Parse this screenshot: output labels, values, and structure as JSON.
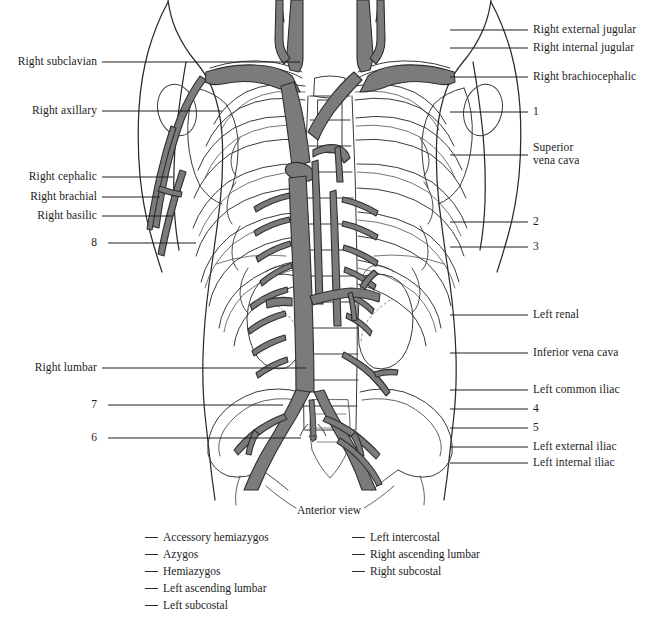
{
  "figure": {
    "title": "Anterior view",
    "view_caption": "Anterior view",
    "colors": {
      "vessel_fill": "#7b7b7b",
      "vessel_stroke": "#2e2e2e",
      "outline_stroke": "#2a2a2a",
      "bone_stroke": "#3a3a3a",
      "leader_line": "#1f1f1f",
      "text": "#1c1c1c",
      "background": "#ffffff"
    }
  },
  "labels_left": [
    {
      "text": "Right subclavian",
      "y": 62,
      "line_y": 62,
      "line_x1": 102,
      "line_x2": 300
    },
    {
      "text": "Right axillary",
      "y": 111,
      "line_y": 111,
      "line_x1": 102,
      "line_x2": 222
    },
    {
      "text": "Right cephalic",
      "y": 177,
      "line_y": 177,
      "line_x1": 102,
      "line_x2": 173
    },
    {
      "text": "Right brachial",
      "y": 197,
      "line_y": 197,
      "line_x1": 102,
      "line_x2": 160
    },
    {
      "text": "Right basilic",
      "y": 216,
      "line_y": 216,
      "line_x1": 102,
      "line_x2": 173
    },
    {
      "text": "8",
      "y": 243,
      "line_y": 243,
      "line_x1": 108,
      "line_x2": 196
    },
    {
      "text": "Right lumbar",
      "y": 368,
      "line_y": 368,
      "line_x1": 102,
      "line_x2": 306
    },
    {
      "text": "7",
      "y": 405,
      "line_y": 405,
      "line_x1": 108,
      "line_x2": 283
    },
    {
      "text": "6",
      "y": 438,
      "line_y": 438,
      "line_x1": 108,
      "line_x2": 301
    }
  ],
  "labels_right": [
    {
      "text": "Right external jugular",
      "y": 30,
      "line_y": 30,
      "line_x1": 450,
      "line_x2": 528
    },
    {
      "text": "Right internal jugular",
      "y": 48,
      "line_y": 48,
      "line_x1": 450,
      "line_x2": 528
    },
    {
      "text": "Right brachiocephalic",
      "y": 77,
      "line_y": 77,
      "line_x1": 450,
      "line_x2": 528
    },
    {
      "text": "1",
      "y": 112,
      "line_y": 112,
      "line_x1": 450,
      "line_x2": 528
    },
    {
      "text": "Superior\nvena cava",
      "y": 148,
      "line_y": 155,
      "line_x1": 450,
      "line_x2": 528
    },
    {
      "text": "2",
      "y": 222,
      "line_y": 222,
      "line_x1": 450,
      "line_x2": 528
    },
    {
      "text": "3",
      "y": 247,
      "line_y": 247,
      "line_x1": 450,
      "line_x2": 528
    },
    {
      "text": "Left renal",
      "y": 315,
      "line_y": 315,
      "line_x1": 450,
      "line_x2": 528
    },
    {
      "text": "Inferior vena cava",
      "y": 353,
      "line_y": 353,
      "line_x1": 450,
      "line_x2": 528
    },
    {
      "text": "Left common iliac",
      "y": 390,
      "line_y": 390,
      "line_x1": 450,
      "line_x2": 528
    },
    {
      "text": "4",
      "y": 409,
      "line_y": 409,
      "line_x1": 450,
      "line_x2": 528
    },
    {
      "text": "5",
      "y": 428,
      "line_y": 428,
      "line_x1": 450,
      "line_x2": 528
    },
    {
      "text": "Left external iliac",
      "y": 447,
      "line_y": 447,
      "line_x1": 450,
      "line_x2": 528
    },
    {
      "text": "Left internal iliac",
      "y": 463,
      "line_y": 463,
      "line_x1": 450,
      "line_x2": 528
    }
  ],
  "legend": {
    "column_left": [
      "Accessory hemiazygos",
      "Azygos",
      "Hemiazygos",
      "Left ascending lumbar",
      "Left subcostal"
    ],
    "column_right": [
      "Left intercostal",
      "Right ascending lumbar",
      "Right subcostal"
    ]
  }
}
